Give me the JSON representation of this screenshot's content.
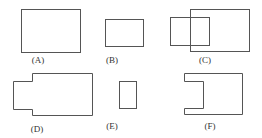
{
  "figure": {
    "labels": {
      "a": "(A)",
      "b": "(B)",
      "c": "(C)",
      "d": "(D)",
      "e": "(E)",
      "f": "(F)"
    },
    "stroke_color": "#555555"
  }
}
